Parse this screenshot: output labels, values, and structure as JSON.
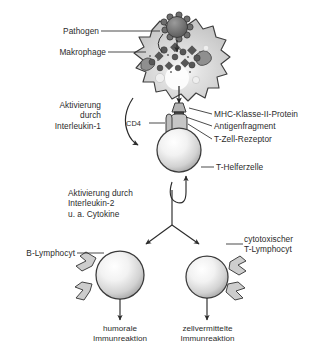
{
  "figure": {
    "language": "de",
    "background_color": "#ffffff",
    "ink_color": "#262626"
  },
  "labels": {
    "pathogen": "Pathogen",
    "makrophage": "Makrophage",
    "aktivierung_il1": "Aktivierung\ndurch\nInterleukin-1",
    "cd4": "CD4",
    "mhc": "MHC-Klasse-II-Protein",
    "antigenfragment": "Antigenfragment",
    "tzell_rezeptor": "T-Zell-Rezeptor",
    "thelferzelle": "T-Helferzelle",
    "aktivierung_il2": "Aktivierung durch\nInterleukin-2\nu. a. Cytokine",
    "b_lymphocyt": "B-Lymphocyt",
    "cytotox": "cytotoxischer\nT-Lymphocyt",
    "humorale": "humorale\nImmunreaktion",
    "zellvermittelte": "zellvermittelte\nImmunreaktion"
  },
  "shapes": {
    "pathogen_icon": "spiked-sphere",
    "macrophage_icon": "amoeboid-cell",
    "t_helper_icon": "round-cell",
    "b_cell_icon": "round-cell-with-antibodies",
    "cytotoxic_icon": "round-cell-with-receptors",
    "mhc_icon": "trapezoid-protein",
    "antigen_icon": "dark-square",
    "cd4_icon": "coreceptor-bar"
  },
  "colors": {
    "cell_fill_light": "#e8e8e8",
    "cell_fill_mid": "#c9c9c9",
    "cell_fill_dark": "#9a9a9a",
    "pathogen_fill": "#6e6e6e",
    "antigen_dark": "#4a4a4a",
    "outline": "#3a3a3a",
    "highlight": "#fdfdfd"
  }
}
